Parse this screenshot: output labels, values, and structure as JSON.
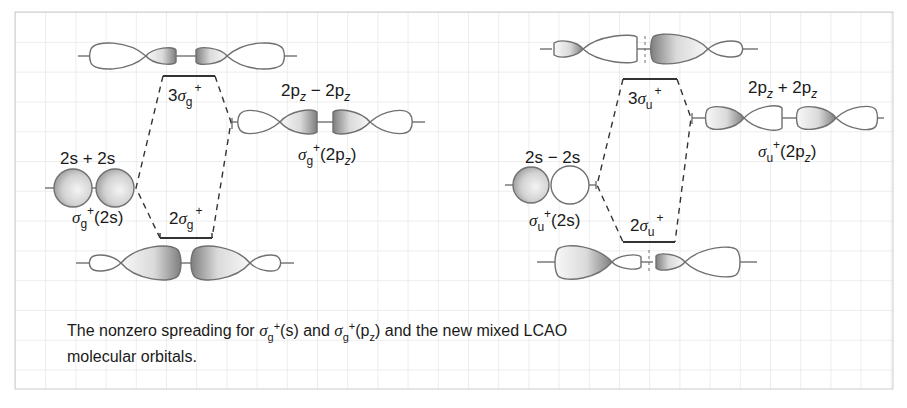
{
  "figure": {
    "caption_parts": {
      "prefix": "The nonzero spreading for ",
      "sym1": "σ",
      "sym1_sub": "g",
      "sym1_sup": "+",
      "sym1_arg": "(s)",
      "mid": " and ",
      "sym2": "σ",
      "sym2_sub": "g",
      "sym2_sup": "+",
      "sym2_arg_open": "(p",
      "sym2_arg_sub": "z",
      "sym2_arg_close": ")",
      "suffix": " and the new mixed LCAO",
      "line2": "molecular orbitals."
    },
    "caption": "The nonzero spreading for σg+(s) and σg+(pz) and the new mixed LCAO molecular orbitals."
  },
  "left_panel": {
    "upper_level": {
      "num": "3",
      "sym": "σ",
      "sub": "g",
      "sup": "+"
    },
    "lower_level": {
      "num": "2",
      "sym": "σ",
      "sub": "g",
      "sup": "+"
    },
    "s_combo": {
      "label": "2s + 2s",
      "mo_sym": "σ",
      "mo_sub": "g",
      "mo_sup": "+",
      "mo_arg": "(2s)"
    },
    "p_combo": {
      "label_a": "2p",
      "label_a_sub": "z",
      "label_op": " − ",
      "label_b": "2p",
      "label_b_sub": "z",
      "mo_sym": "σ",
      "mo_sub": "g",
      "mo_sup": "+",
      "mo_arg_open": "(2p",
      "mo_arg_sub": "z",
      "mo_arg_close": ")"
    }
  },
  "right_panel": {
    "upper_level": {
      "num": "3",
      "sym": "σ",
      "sub": "u",
      "sup": "+"
    },
    "lower_level": {
      "num": "2",
      "sym": "σ",
      "sub": "u",
      "sup": "+"
    },
    "s_combo": {
      "label": "2s − 2s",
      "mo_sym": "σ",
      "mo_sub": "u",
      "mo_sup": "+",
      "mo_arg": "(2s)"
    },
    "p_combo": {
      "label_a": "2p",
      "label_a_sub": "z",
      "label_op": " + ",
      "label_b": "2p",
      "label_b_sub": "z",
      "mo_sym": "σ",
      "mo_sub": "u",
      "mo_sup": "+",
      "mo_arg_open": "(2p",
      "mo_arg_sub": "z",
      "mo_arg_close": ")"
    }
  },
  "colors": {
    "grid": "#d9d9d9",
    "border": "#c8c8c8",
    "outline": "#6f6f6f",
    "shade_dark": "#8a8a8a",
    "shade_light": "#f2f2f2",
    "text": "#1a1a1a"
  }
}
